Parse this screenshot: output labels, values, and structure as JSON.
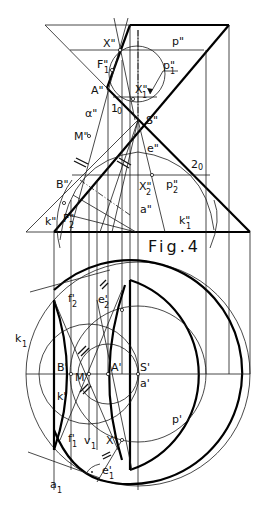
{
  "figure": {
    "caption": "Fig.4",
    "elevation_labels": {
      "X": "X\"",
      "p": "p\"",
      "F1": "F\"",
      "F1_sub": "1",
      "p1": "p\"",
      "p1_sub": "1",
      "A": "A\"",
      "X1": "X\"",
      "X1_sub": "1",
      "one0": "1",
      "one0_sub": "0",
      "alpha": "α\"",
      "S": "S\"",
      "M": "M\"",
      "e": "e\"",
      "two0": "2",
      "two0_sub": "0",
      "B": "B\"",
      "X2": "X\"",
      "X2_sub": "2",
      "p2": "p\"",
      "p2_sub": "2",
      "a": "a\"",
      "k": "k\"",
      "F2": "F\"",
      "F2_sub": "2",
      "k1": "k\"",
      "k1_sub": "1"
    },
    "plan_labels": {
      "f2": "f'",
      "f2_sub": "2",
      "e2": "e'",
      "e2_sub": "2",
      "k1": "k",
      "k1_sub": "1",
      "B": "B'",
      "M": "M'",
      "A": "A'",
      "S": "S'",
      "a": "a'",
      "k": "k'",
      "p": "p'",
      "f1": "f'",
      "f1_sub": "1",
      "v1": "v",
      "v1_sub": "1",
      "X": "X'",
      "e1": "e'",
      "e1_sub": "1",
      "a1": "a",
      "a1_sub": "1"
    }
  }
}
